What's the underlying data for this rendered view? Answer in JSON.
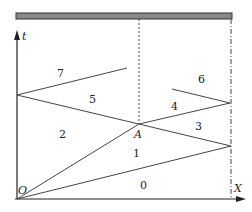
{
  "diagram": {
    "type": "x-t wave diagram (shock tube / piston)",
    "colors": {
      "line": "#444444",
      "bar_fill": "#888888",
      "bar_stroke": "#333333",
      "axis": "#222222"
    },
    "axes": {
      "x_label": "X",
      "t_label": "t",
      "origin_label": "O"
    },
    "points": {
      "A_label": "A"
    },
    "regions": [
      {
        "id": "0",
        "label": "0"
      },
      {
        "id": "1",
        "label": "1"
      },
      {
        "id": "2",
        "label": "2"
      },
      {
        "id": "3",
        "label": "3"
      },
      {
        "id": "4",
        "label": "4"
      },
      {
        "id": "5",
        "label": "5"
      },
      {
        "id": "6",
        "label": "6"
      },
      {
        "id": "7",
        "label": "7"
      }
    ]
  }
}
